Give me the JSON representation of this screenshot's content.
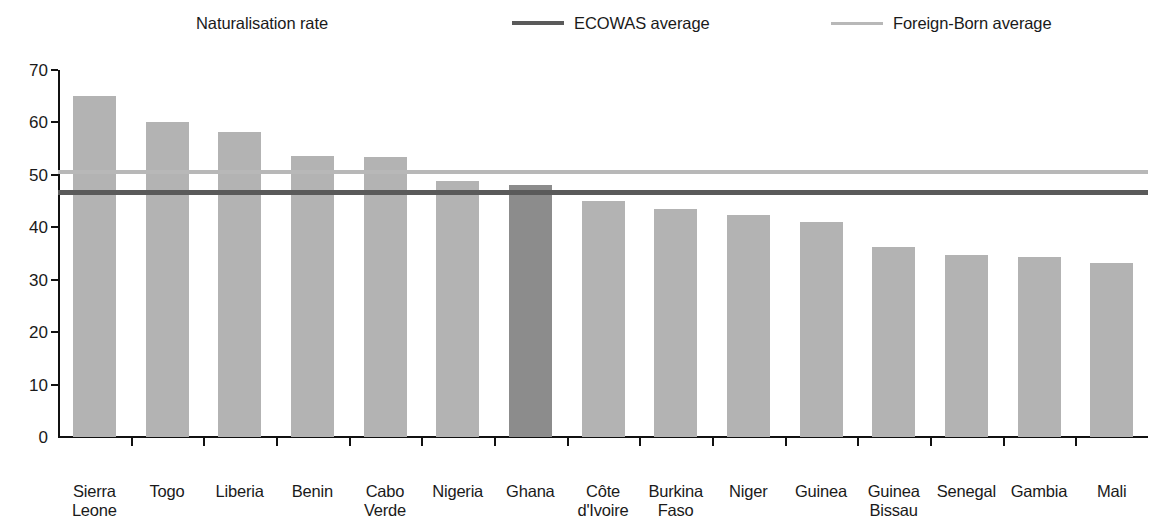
{
  "legend": {
    "items": [
      {
        "label": "Naturalisation rate",
        "marker": "bar-swatch-icon",
        "color": "#b3b3b3"
      },
      {
        "label": "ECOWAS average",
        "marker": "line-swatch-icon",
        "color": "#5a5a5a"
      },
      {
        "label": "Foreign-Born average",
        "marker": "line-swatch-icon",
        "color": "#b8b8b8"
      }
    ]
  },
  "axis": {
    "y_ticks": [
      "0",
      "10",
      "20",
      "30",
      "40",
      "50",
      "60",
      "70"
    ]
  },
  "chart_data": {
    "type": "bar",
    "title": "",
    "xlabel": "",
    "ylabel": "",
    "ylim": [
      0,
      70
    ],
    "ytick_step": 10,
    "grid": false,
    "legend_position": "top",
    "categories": [
      "Sierra Leone",
      "Togo",
      "Liberia",
      "Benin",
      "Cabo Verde",
      "Nigeria",
      "Ghana",
      "Côte d'Ivoire",
      "Burkina Faso",
      "Niger",
      "Guinea",
      "Guinea Bissau",
      "Senegal",
      "Gambia",
      "Mali"
    ],
    "category_lines": [
      [
        "Sierra",
        "Leone"
      ],
      [
        "Togo",
        ""
      ],
      [
        "Liberia",
        ""
      ],
      [
        "Benin",
        ""
      ],
      [
        "Cabo",
        "Verde"
      ],
      [
        "Nigeria",
        ""
      ],
      [
        "Ghana",
        ""
      ],
      [
        "Côte",
        "d'Ivoire"
      ],
      [
        "Burkina",
        "Faso"
      ],
      [
        "Niger",
        ""
      ],
      [
        "Guinea",
        ""
      ],
      [
        "Guinea",
        "Bissau"
      ],
      [
        "Senegal",
        ""
      ],
      [
        "Gambia",
        ""
      ],
      [
        "Mali",
        ""
      ]
    ],
    "series": [
      {
        "name": "Naturalisation rate",
        "type": "bar",
        "values": [
          65.0,
          60.1,
          58.2,
          53.6,
          53.5,
          48.9,
          48.0,
          45.0,
          43.4,
          42.3,
          41.0,
          36.3,
          34.8,
          34.4,
          33.1
        ],
        "color": "#b3b3b3",
        "highlight_index": 6,
        "highlight_color": "#8c8c8c"
      },
      {
        "name": "ECOWAS average",
        "type": "hline",
        "value": 46.7,
        "color": "#5a5a5a"
      },
      {
        "name": "Foreign-Born average",
        "type": "hline",
        "value": 50.5,
        "color": "#b8b8b8"
      }
    ]
  }
}
